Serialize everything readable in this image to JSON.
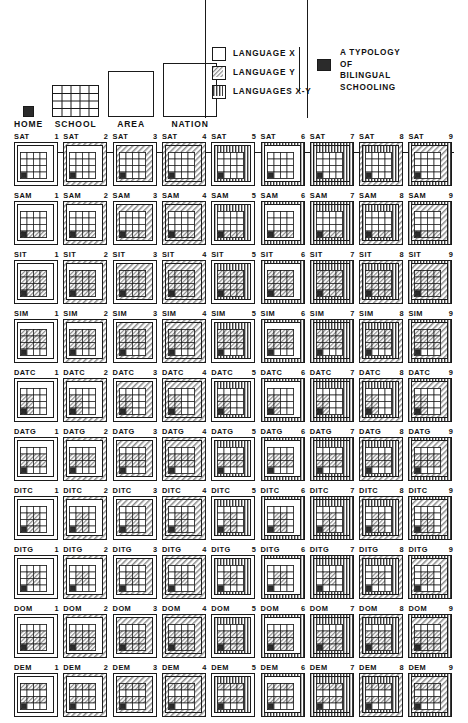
{
  "title": {
    "lines": [
      "A TYPOLOGY",
      "OF",
      "BILINGUAL",
      "SCHOOLING"
    ],
    "swatch_color": "#2b2b2b"
  },
  "key": {
    "items": [
      {
        "label": "HOME",
        "shape": "filled-square",
        "icon": "home-icon"
      },
      {
        "label": "SCHOOL",
        "shape": "grid-square",
        "icon": "school-grid-icon"
      },
      {
        "label": "AREA",
        "shape": "open-square",
        "icon": "area-square-icon"
      },
      {
        "label": "NATION",
        "shape": "open-square",
        "icon": "nation-square-icon"
      }
    ]
  },
  "legend": {
    "items": [
      {
        "label": "LANGUAGE X",
        "pattern": "blank"
      },
      {
        "label": "LANGUAGE Y",
        "pattern": "diagonal-hatch"
      },
      {
        "label": "LANGUAGES X-Y",
        "pattern": "vertical-stripe"
      }
    ]
  },
  "colors": {
    "ink": "#1a1a1a",
    "home_fill": "#2b2b2b",
    "paper": "#ffffff"
  },
  "matrix": {
    "column_numbers": [
      1,
      2,
      3,
      4,
      5,
      6,
      7,
      8,
      9
    ],
    "column_patterns": [
      {
        "n": 1,
        "area": "blank",
        "nation": "blank"
      },
      {
        "n": 2,
        "area": "blank",
        "nation": "hatch"
      },
      {
        "n": 3,
        "area": "hatch",
        "nation": "blank"
      },
      {
        "n": 4,
        "area": "hatch",
        "nation": "hatch"
      },
      {
        "n": 5,
        "area": "stripe",
        "nation": "blank"
      },
      {
        "n": 6,
        "area": "blank",
        "nation": "stripe"
      },
      {
        "n": 7,
        "area": "stripe",
        "nation": "stripe"
      },
      {
        "n": 8,
        "area": "stripe",
        "nation": "hatch"
      },
      {
        "n": 9,
        "area": "hatch",
        "nation": "stripe"
      }
    ],
    "rows": [
      {
        "label": "SAT",
        "home": "hatch",
        "school": [
          [
            "b",
            "b",
            "b",
            "b"
          ],
          [
            "b",
            "b",
            "b",
            "b"
          ],
          [
            "b",
            "b",
            "b",
            "b"
          ],
          [
            "b",
            "b",
            "b",
            "b"
          ]
        ]
      },
      {
        "label": "SAM",
        "home": "hatch",
        "school": [
          [
            "b",
            "b",
            "b",
            "b"
          ],
          [
            "b",
            "b",
            "b",
            "b"
          ],
          [
            "b",
            "b",
            "b",
            "b"
          ],
          [
            "h",
            "h",
            "h",
            "h"
          ]
        ]
      },
      {
        "label": "SIT",
        "home": "hatch",
        "school": [
          [
            "h",
            "h",
            "h",
            "h"
          ],
          [
            "h",
            "h",
            "h",
            "h"
          ],
          [
            "h",
            "h",
            "h",
            "h"
          ],
          [
            "h",
            "h",
            "h",
            "h"
          ]
        ]
      },
      {
        "label": "SIM",
        "home": "hatch",
        "school": [
          [
            "h",
            "h",
            "h",
            "h"
          ],
          [
            "h",
            "h",
            "h",
            "h"
          ],
          [
            "h",
            "h",
            "h",
            "h"
          ],
          [
            "b",
            "b",
            "b",
            "b"
          ]
        ]
      },
      {
        "label": "DATC",
        "home": "hatch",
        "school": [
          [
            "b",
            "b",
            "b",
            "b"
          ],
          [
            "h",
            "h",
            "b",
            "b"
          ],
          [
            "h",
            "h",
            "b",
            "b"
          ],
          [
            "h",
            "h",
            "b",
            "b"
          ]
        ]
      },
      {
        "label": "DATG",
        "home": "hatch",
        "school": [
          [
            "b",
            "b",
            "b",
            "b"
          ],
          [
            "h",
            "h",
            "h",
            "h"
          ],
          [
            "h",
            "h",
            "h",
            "h"
          ],
          [
            "b",
            "b",
            "b",
            "b"
          ]
        ]
      },
      {
        "label": "DITC",
        "home": "hatch",
        "school": [
          [
            "b",
            "b",
            "b",
            "b"
          ],
          [
            "b",
            "h",
            "h",
            "b"
          ],
          [
            "b",
            "h",
            "h",
            "b"
          ],
          [
            "b",
            "h",
            "h",
            "b"
          ]
        ]
      },
      {
        "label": "DITG",
        "home": "hatch",
        "school": [
          [
            "b",
            "b",
            "b",
            "b"
          ],
          [
            "b",
            "h",
            "h",
            "b"
          ],
          [
            "b",
            "h",
            "h",
            "b"
          ],
          [
            "b",
            "b",
            "b",
            "b"
          ]
        ]
      },
      {
        "label": "DOM",
        "home": "hatch",
        "school": [
          [
            "b",
            "b",
            "b",
            "b"
          ],
          [
            "h",
            "h",
            "h",
            "h"
          ],
          [
            "h",
            "h",
            "h",
            "h"
          ],
          [
            "h",
            "h",
            "h",
            "h"
          ]
        ]
      },
      {
        "label": "DEM",
        "home": "hatch",
        "school": [
          [
            "h",
            "h",
            "h",
            "h"
          ],
          [
            "b",
            "b",
            "b",
            "b"
          ],
          [
            "h",
            "h",
            "h",
            "h"
          ],
          [
            "b",
            "b",
            "b",
            "b"
          ]
        ]
      }
    ]
  }
}
